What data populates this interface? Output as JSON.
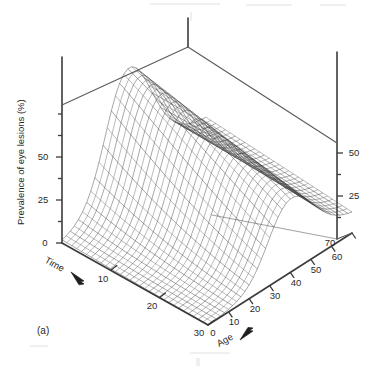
{
  "figure": {
    "panel_label": "(a)",
    "background_color": "#ffffff",
    "ink_color": "#2e2e2e"
  },
  "chart_data": {
    "type": "line",
    "render": "3d-wireframe-surface",
    "title": "",
    "subtitle": "",
    "panel": "(a)",
    "zlabel": "Prevalence of eye lesions (%)",
    "xlabel": "Age",
    "ylabel": "Time",
    "xlabel_suffix": "→",
    "ylabel_suffix": "→",
    "xlim": [
      0,
      70
    ],
    "ylim": [
      0,
      30
    ],
    "zlim": [
      0,
      75
    ],
    "xticks": [
      0,
      10,
      20,
      30,
      40,
      50,
      60,
      70
    ],
    "yticks": [
      0,
      10,
      20,
      30
    ],
    "zticks": [
      0,
      25,
      50
    ],
    "zticks_right": [
      25,
      50
    ],
    "xticklabels": [
      "0",
      "10",
      "20",
      "30",
      "40",
      "50",
      "60",
      "70"
    ],
    "yticklabels": [
      "0",
      "10",
      "20",
      "30"
    ],
    "zticklabels": [
      "0",
      "25",
      "50"
    ],
    "grid": false,
    "legend": false,
    "legend_position": "none",
    "x_name": "Age (years)",
    "y_name": "Time (years)",
    "z_name": "Prevalence of eye lesions (%)",
    "x_grid": [
      0,
      2,
      4,
      6,
      8,
      10,
      12,
      14,
      16,
      18,
      20,
      22,
      24,
      26,
      28,
      30,
      32,
      34,
      36,
      38,
      40,
      42,
      44,
      46,
      48,
      50,
      52,
      54,
      56,
      58,
      60,
      62,
      64,
      66,
      68,
      70
    ],
    "y_grid": [
      0,
      1,
      2,
      3,
      4,
      5,
      6,
      7,
      8,
      9,
      10,
      11,
      12,
      13,
      14,
      15,
      16,
      17,
      18,
      19,
      20,
      21,
      22,
      23,
      24,
      25,
      26,
      27,
      28,
      29,
      30
    ],
    "surface_model": {
      "form": "z = A(time) * logistic((age - age50(time)) / width(time)) * decay(age, time)",
      "amplitude_at_time_0": 72,
      "amplitude_at_time_30": 40,
      "age50_at_time_0": 22,
      "age50_at_time_30": 30,
      "rise_width": 5.5,
      "decline_onset_age": 42,
      "decline_width": 14,
      "decline_floor": 0.18
    },
    "sample_series": [
      {
        "name": "Time = 0",
        "x": [
          0,
          10,
          20,
          30,
          40,
          50,
          60,
          70
        ],
        "values": [
          0.4,
          4.0,
          34.0,
          70.0,
          71.0,
          52.0,
          28.0,
          16.0
        ]
      },
      {
        "name": "Time = 10",
        "x": [
          0,
          10,
          20,
          30,
          40,
          50,
          60,
          70
        ],
        "values": [
          0.3,
          2.6,
          24.0,
          60.0,
          62.0,
          45.0,
          24.0,
          13.0
        ]
      },
      {
        "name": "Time = 20",
        "x": [
          0,
          10,
          20,
          30,
          40,
          50,
          60,
          70
        ],
        "values": [
          0.2,
          1.6,
          14.0,
          48.0,
          52.0,
          37.0,
          19.0,
          10.0
        ]
      },
      {
        "name": "Time = 30",
        "x": [
          0,
          10,
          20,
          30,
          40,
          50,
          60,
          70
        ],
        "values": [
          0.1,
          0.9,
          8.0,
          34.0,
          40.0,
          29.0,
          15.0,
          8.0
        ]
      }
    ]
  }
}
